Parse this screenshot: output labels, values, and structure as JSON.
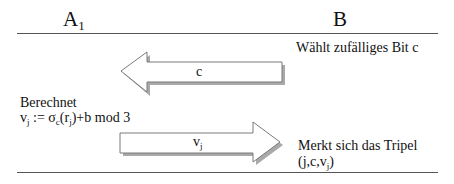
{
  "parties": {
    "left": {
      "name": "A",
      "subscript": "1"
    },
    "right": {
      "name": "B"
    }
  },
  "steps": {
    "b_chooses": "Wählt zufälliges Bit  c",
    "a_computes_title": "Berechnet",
    "a_computes_formula": {
      "v": "v",
      "v_sub": "j",
      "assign": " := σ",
      "sigma_sub": "c",
      "open_r": "(r",
      "r_sub": "j",
      "rest": ")+b mod 3"
    },
    "b_stores_title": "Merkt sich das Tripel",
    "b_stores_tuple": {
      "prefix": "(j,c,v",
      "sub": "j",
      "suffix": ")"
    }
  },
  "messages": [
    {
      "direction": "B-to-A",
      "label": "c"
    },
    {
      "direction": "A-to-B",
      "label": "v",
      "label_sub": "j"
    }
  ],
  "colors": {
    "line": "#555555",
    "arrow_outline": "#7a7a7a",
    "arrow_fill": "#ffffff",
    "arrow_shadow": "#9a9a9a",
    "text": "#111111"
  }
}
